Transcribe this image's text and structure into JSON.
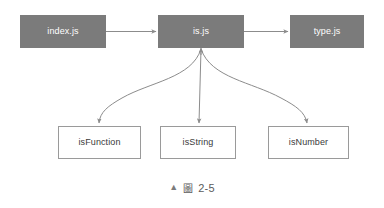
{
  "figure": {
    "caption_marker": "▲",
    "caption_label": "圖",
    "caption_number": "2-5"
  },
  "colors": {
    "module_fill": "#7b7b7b",
    "module_text": "#ffffff",
    "export_fill": "#ffffff",
    "export_border": "#9a9a9a",
    "export_text": "#3a3a3a",
    "connector": "#8c8c8c",
    "background": "#ffffff"
  },
  "diagram": {
    "type": "flow-diagram",
    "modules": [
      {
        "id": "index",
        "label": "index.js"
      },
      {
        "id": "is",
        "label": "is.js"
      },
      {
        "id": "type",
        "label": "type.js"
      }
    ],
    "exports": [
      {
        "id": "isfunction",
        "label": "isFunction"
      },
      {
        "id": "isstring",
        "label": "isString"
      },
      {
        "id": "isnumber",
        "label": "isNumber"
      }
    ],
    "connections": [
      {
        "from": "index",
        "to": "is",
        "style": "straight-horizontal"
      },
      {
        "from": "is",
        "to": "type",
        "style": "straight-horizontal"
      },
      {
        "from": "is",
        "to": "isfunction",
        "style": "curved-down-left"
      },
      {
        "from": "is",
        "to": "isstring",
        "style": "straight-down"
      },
      {
        "from": "is",
        "to": "isnumber",
        "style": "curved-down-right"
      }
    ]
  }
}
